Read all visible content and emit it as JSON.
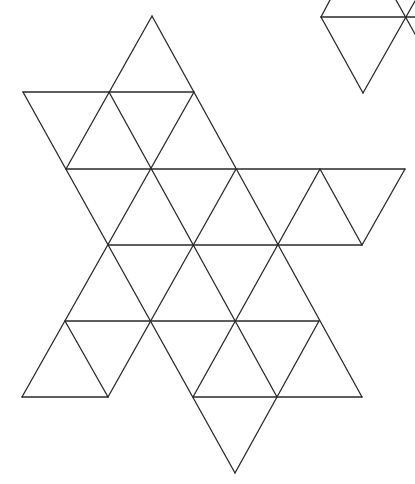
{
  "diagram": {
    "type": "triangular-net",
    "background": "#ffffff",
    "stroke_color": "#2a2a2a",
    "segments": [
      [
        321,
        17,
        415,
        17
      ],
      [
        23,
        92,
        194,
        92
      ],
      [
        66,
        169,
        405,
        169
      ],
      [
        108,
        245,
        362,
        245
      ],
      [
        65,
        321,
        319,
        321
      ],
      [
        22,
        397,
        108,
        397
      ],
      [
        193,
        397,
        362,
        397
      ],
      [
        152,
        16,
        362,
        397
      ],
      [
        109,
        92,
        277,
        397
      ],
      [
        23,
        92,
        235,
        473
      ],
      [
        320,
        169,
        362,
        245
      ],
      [
        65,
        321,
        108,
        397
      ],
      [
        321,
        17,
        363,
        93
      ],
      [
        396,
        0,
        415,
        34
      ],
      [
        152,
        16,
        66,
        169
      ],
      [
        194,
        92,
        22,
        397
      ],
      [
        236,
        169,
        108,
        397
      ],
      [
        320,
        169,
        193,
        397
      ],
      [
        405,
        169,
        362,
        245
      ],
      [
        319,
        321,
        235,
        473
      ],
      [
        363,
        93,
        415,
        1
      ],
      [
        321,
        17,
        330,
        0
      ]
    ]
  }
}
